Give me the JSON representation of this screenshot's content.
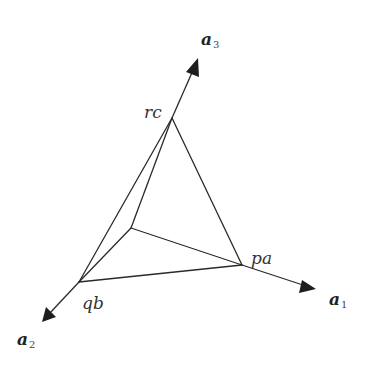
{
  "diagram": {
    "type": "3d-axes-with-plane-intercepts",
    "axes": [
      {
        "id": "a1",
        "base": "a",
        "sub": "1"
      },
      {
        "id": "a2",
        "base": "a",
        "sub": "2"
      },
      {
        "id": "a3",
        "base": "a",
        "sub": "3"
      }
    ],
    "vertices": {
      "pa": {
        "label": "pa"
      },
      "qb": {
        "label": "qb"
      },
      "rc": {
        "label": "rc"
      }
    },
    "labels": {
      "a1_base": "a",
      "a1_sub": "1",
      "a2_base": "a",
      "a2_sub": "2",
      "a3_base": "a",
      "a3_sub": "3",
      "pa": "pa",
      "qb": "qb",
      "rc": "rc"
    },
    "edges": [
      [
        "origin",
        "pa"
      ],
      [
        "origin",
        "qb"
      ],
      [
        "origin",
        "rc"
      ],
      [
        "pa",
        "qb"
      ],
      [
        "qb",
        "rc"
      ],
      [
        "rc",
        "pa"
      ]
    ]
  }
}
